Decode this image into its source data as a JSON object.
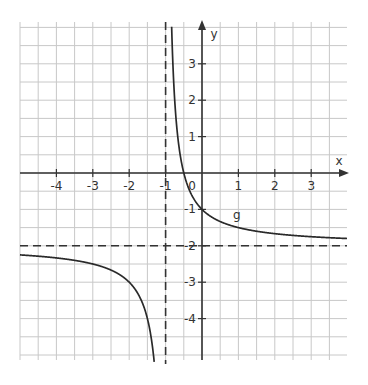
{
  "chart_data": {
    "type": "line",
    "title": "",
    "xlabel": "x",
    "ylabel": "y",
    "xlim": [
      -5,
      4
    ],
    "ylim": [
      -5,
      4
    ],
    "grid": true,
    "grid_step": 0.5,
    "x_tick_labels": [
      "-4",
      "-3",
      "-2",
      "-1",
      "0",
      "1",
      "2",
      "3"
    ],
    "y_tick_labels": [
      "3",
      "2",
      "1",
      "-1",
      "-2",
      "-3",
      "-4"
    ],
    "series": [
      {
        "name": "g",
        "formula": "g(x) = 1/(x+1) - 2",
        "points": [
          {
            "x": -5,
            "y": -2.25
          },
          {
            "x": -4,
            "y": -2.33
          },
          {
            "x": -3,
            "y": -2.5
          },
          {
            "x": -2,
            "y": -3
          },
          {
            "x": -1.5,
            "y": -4
          },
          {
            "x": -1.2,
            "y": -7
          },
          {
            "x": -0.8,
            "y": 3
          },
          {
            "x": -0.5,
            "y": 0
          },
          {
            "x": 0,
            "y": -1
          },
          {
            "x": 1,
            "y": -1.5
          },
          {
            "x": 2,
            "y": -1.67
          },
          {
            "x": 3,
            "y": -1.75
          },
          {
            "x": 4,
            "y": -1.8
          }
        ]
      }
    ],
    "asymptotes": [
      {
        "type": "vertical",
        "x": -1,
        "style": "dashed"
      },
      {
        "type": "horizontal",
        "y": -2,
        "style": "dashed"
      }
    ],
    "annotations": [
      {
        "text": "g",
        "x": 0.8,
        "y": -1.2
      }
    ],
    "colors": {
      "grid": "#c8c8c8",
      "axis": "#333333",
      "curve": "#2a2a2a"
    }
  }
}
